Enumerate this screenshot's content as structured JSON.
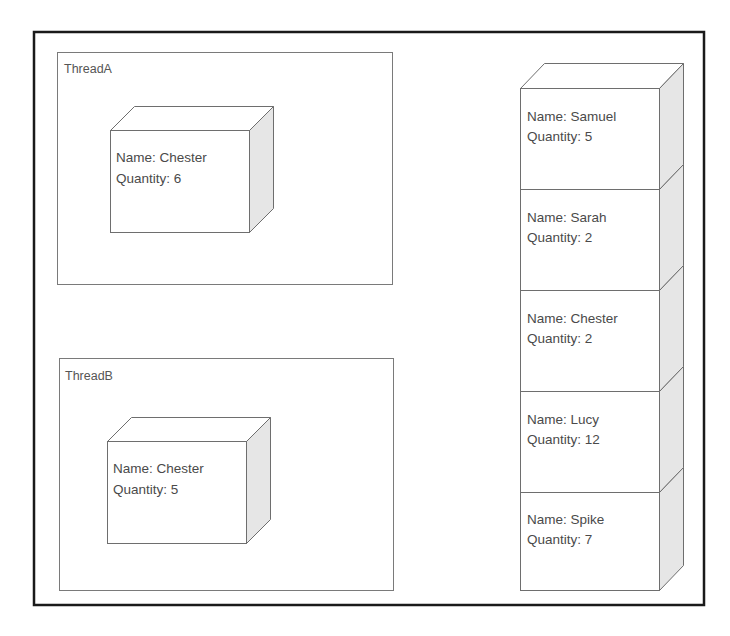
{
  "diagram": {
    "threads": [
      {
        "label": "ThreadA",
        "item": {
          "name_line": "Name: Chester",
          "quantity_line": "Quantity: 6"
        }
      },
      {
        "label": "ThreadB",
        "item": {
          "name_line": "Name: Chester",
          "quantity_line": "Quantity: 5"
        }
      }
    ],
    "stack": [
      {
        "name_line": "Name: Samuel",
        "quantity_line": "Quantity: 5"
      },
      {
        "name_line": "Name: Sarah",
        "quantity_line": "Quantity: 2"
      },
      {
        "name_line": "Name: Chester",
        "quantity_line": "Quantity: 2"
      },
      {
        "name_line": "Name: Lucy",
        "quantity_line": "Quantity: 12"
      },
      {
        "name_line": "Name: Spike",
        "quantity_line": "Quantity: 7"
      }
    ],
    "colors": {
      "outer_border": "#1a1a1a",
      "box_border": "#7a7a7a",
      "side_face": "#e6e6e6",
      "text": "#4a4a4a"
    }
  }
}
